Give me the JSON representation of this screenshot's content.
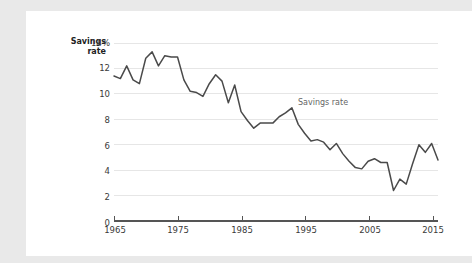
{
  "chart_data": {
    "type": "line",
    "title": "",
    "xlabel": "",
    "ylabel": "Savings rate",
    "ylabel_line1": "Savings",
    "ylabel_line2": "rate",
    "series_annotation": "Savings rate",
    "xlim": [
      1965,
      2016
    ],
    "ylim": [
      0,
      14
    ],
    "grid": "horizontal",
    "legend_position": "inline-annotation",
    "line_color": "#4a4a4a",
    "gridline_color": "#e4e4e4",
    "axis_color": "#555555",
    "background_color": "#ffffff",
    "page_background_color": "#e9e9e9",
    "ytick_labels": [
      "14%",
      "12",
      "10",
      "8",
      "6",
      "4",
      "2",
      "0"
    ],
    "ytick_values": [
      14,
      12,
      10,
      8,
      6,
      4,
      2,
      0
    ],
    "xtick_labels": [
      "1965",
      "1975",
      "1985",
      "1995",
      "2005",
      "2015"
    ],
    "xtick_values": [
      1965,
      1975,
      1985,
      1995,
      2005,
      2015
    ],
    "series": [
      {
        "name": "Savings rate",
        "x": [
          1965,
          1966,
          1967,
          1968,
          1969,
          1970,
          1971,
          1972,
          1973,
          1974,
          1975,
          1976,
          1977,
          1978,
          1979,
          1980,
          1981,
          1982,
          1983,
          1984,
          1985,
          1986,
          1987,
          1988,
          1989,
          1990,
          1991,
          1992,
          1993,
          1994,
          1995,
          1996,
          1997,
          1998,
          1999,
          2000,
          2001,
          2002,
          2003,
          2004,
          2005,
          2006,
          2007,
          2008,
          2009,
          2010,
          2011,
          2012,
          2013,
          2014,
          2015
        ],
        "values": [
          11.4,
          11.2,
          12.2,
          11.1,
          10.8,
          12.8,
          13.3,
          12.2,
          13.0,
          12.9,
          12.9,
          11.1,
          10.2,
          10.1,
          9.8,
          10.8,
          11.5,
          11.0,
          9.3,
          10.7,
          8.6,
          7.9,
          7.3,
          7.7,
          7.7,
          7.7,
          8.2,
          8.5,
          8.9,
          7.6,
          6.9,
          6.3,
          6.4,
          6.2,
          5.6,
          6.1,
          5.3,
          4.7,
          4.2,
          4.1,
          4.7,
          4.9,
          4.6,
          4.6,
          2.4,
          3.3,
          2.9,
          4.5,
          6.0,
          5.4,
          6.1
        ],
        "peak_value": 13.3,
        "peak_year": 1971,
        "trough_value": 2.4,
        "trough_year": 2009,
        "final_value": 4.8,
        "final_year": 2016
      }
    ]
  }
}
